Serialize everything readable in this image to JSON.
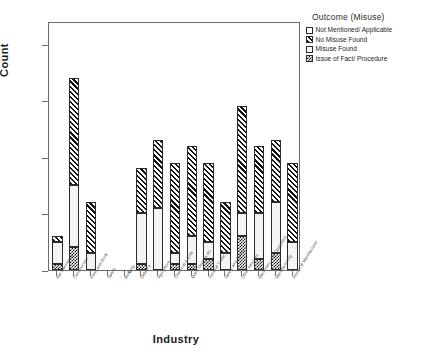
{
  "chart_data": {
    "type": "bar",
    "subtype": "stacked-bar",
    "title": "",
    "xlabel": "Industry",
    "ylabel": "Count",
    "ylim": [
      0,
      44
    ],
    "yticks": [
      0,
      10,
      20,
      30,
      40
    ],
    "ytick_labels": [
      "0",
      "10",
      "20",
      "30",
      "40"
    ],
    "grid": false,
    "legend_position": "right",
    "legend_title": "Outcome (Misuse)",
    "categories": [
      "Not Mentioned",
      "Construction",
      "Food and Drink",
      "Sports",
      "Building",
      "Defence",
      "Agriculture",
      "Chemical & Ents",
      "Motor Dealers etc",
      "General Trade etc",
      "Sports and Camp",
      "Other Services",
      "Machinery and Equipment",
      "Manufacturing",
      "Advice of Manufacturer"
    ],
    "series": [
      {
        "name": "Issue of Fact/ Procedure",
        "pattern": "checker",
        "values": [
          1,
          4,
          0,
          0,
          0,
          1,
          0,
          1,
          1,
          2,
          0,
          6,
          2,
          3,
          0
        ]
      },
      {
        "name": "Misuse Found",
        "pattern": "dotted",
        "values": [
          4,
          11,
          3,
          0,
          0,
          9,
          11,
          2,
          5,
          3,
          3,
          4,
          8,
          9,
          5
        ]
      },
      {
        "name": "No Misuse Found",
        "pattern": "hatch",
        "values": [
          1,
          19,
          9,
          0,
          0,
          8,
          12,
          16,
          16,
          14,
          9,
          19,
          12,
          11,
          14
        ]
      },
      {
        "name": "Not Mentioned/ Applicable",
        "pattern": "white",
        "values": [
          0,
          0,
          0,
          0,
          0,
          0,
          0,
          0,
          0,
          0,
          0,
          0,
          0,
          0,
          0
        ]
      }
    ],
    "totals": [
      6,
      34,
      12,
      0,
      0,
      18,
      23,
      19,
      22,
      19,
      12,
      29,
      22,
      23,
      19
    ]
  },
  "legend": {
    "title": "Outcome (Misuse)",
    "items": [
      {
        "label": "Not Mentioned/ Applicable",
        "pattern": "white"
      },
      {
        "label": "No Misuse Found",
        "pattern": "hatch"
      },
      {
        "label": "Misuse Found",
        "pattern": "dotted"
      },
      {
        "label": "Issue of Fact/ Procedure",
        "pattern": "checker"
      }
    ]
  },
  "axes": {
    "y_title": "Count",
    "x_title": "Industry"
  }
}
